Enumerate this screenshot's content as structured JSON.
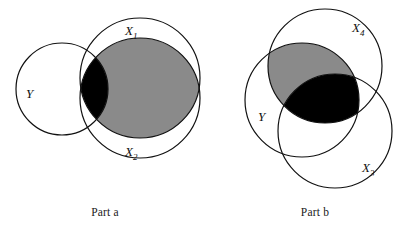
{
  "figure": {
    "type": "venn-diagram-pair",
    "background_color": "#ffffff",
    "stroke_color": "#111111",
    "shaded_dark_color": "#000000",
    "shaded_gray_color": "#8a8a8a"
  },
  "panels": [
    {
      "id": "part-a",
      "caption": "Part a",
      "labels": {
        "y": "Y",
        "x1_base": "X",
        "x1_sub": "1",
        "x2_base": "X",
        "x2_sub": "2"
      },
      "circles": [
        {
          "name": "Y",
          "cx": 62,
          "cy": 89,
          "r": 46
        },
        {
          "name": "X1",
          "cx": 140,
          "cy": 78,
          "r": 60
        },
        {
          "name": "X2",
          "cx": 140,
          "cy": 98,
          "r": 60
        }
      ],
      "regions": [
        {
          "name": "black-region",
          "fill": "#000000",
          "meaning": "Y and X1 and X2"
        },
        {
          "name": "gray-region",
          "fill": "#8a8a8a",
          "meaning": "X1 and X2 not Y"
        }
      ]
    },
    {
      "id": "part-b",
      "caption": "Part b",
      "labels": {
        "y": "Y",
        "x4_base": "X",
        "x4_sub": "4",
        "x3_base": "X",
        "x3_sub": "3"
      },
      "circles": [
        {
          "name": "X4",
          "cx": 115,
          "cy": 66,
          "r": 57
        },
        {
          "name": "Y",
          "cx": 92,
          "cy": 100,
          "r": 57
        },
        {
          "name": "X3",
          "cx": 125,
          "cy": 131,
          "r": 57
        }
      ],
      "regions": [
        {
          "name": "black-region",
          "fill": "#000000",
          "meaning": "X4 and Y and X3"
        },
        {
          "name": "gray-region",
          "fill": "#8a8a8a",
          "meaning": "X4 and Y not X3"
        }
      ]
    }
  ]
}
